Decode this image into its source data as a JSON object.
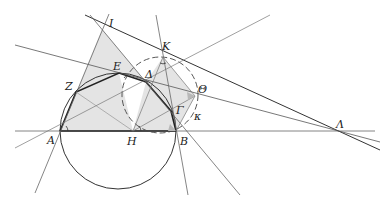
{
  "diagram": {
    "type": "geometry-construction",
    "points": {
      "A": {
        "label": "Α",
        "x": 60,
        "y": 131
      },
      "B": {
        "label": "Β",
        "x": 176,
        "y": 131
      },
      "H": {
        "label": "Η",
        "x": 133,
        "y": 131
      },
      "Gamma": {
        "label": "Γ",
        "x": 171,
        "y": 111
      },
      "Delta": {
        "label": "Δ",
        "x": 146,
        "y": 82
      },
      "E": {
        "label": "Ε",
        "x": 119,
        "y": 73
      },
      "Z": {
        "label": "Ζ",
        "x": 76,
        "y": 92
      },
      "Theta": {
        "label": "Θ",
        "x": 195,
        "y": 96
      },
      "I": {
        "label": "Ι",
        "x": 102,
        "y": 29
      },
      "K": {
        "label": "Κ",
        "x": 163,
        "y": 57
      },
      "Lambda": {
        "label": "Λ",
        "x": 338,
        "y": 133
      }
    },
    "circles": {
      "main": {
        "cx": 118,
        "cy": 131,
        "r": 58
      },
      "kappa": {
        "label": "κ",
        "cx": 160,
        "cy": 95,
        "r": 38
      }
    },
    "colors": {
      "line": "#555555",
      "thick": "#222222",
      "fill": "#e2e2e2",
      "angle_fill": "#b8b8b8"
    }
  }
}
